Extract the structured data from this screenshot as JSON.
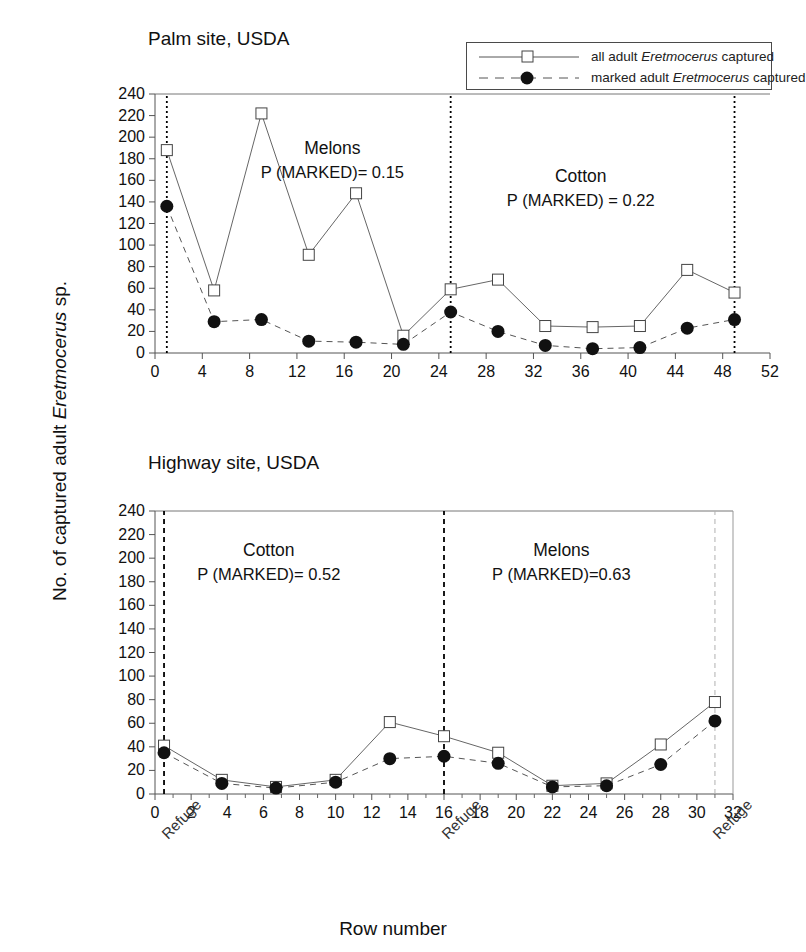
{
  "figure": {
    "ylabel_prefix": "No. of captured adult ",
    "ylabel_italic": "Eretmocerus",
    "ylabel_suffix": " sp.",
    "xlabel": "Row number"
  },
  "legend": {
    "all": {
      "prefix": "all adult ",
      "italic": "Eretmocerus",
      "suffix": " captured"
    },
    "marked": {
      "prefix": "marked adult ",
      "italic": "Eretmocerus",
      "suffix": " captured"
    }
  },
  "chart_data": [
    {
      "id": "palm",
      "type": "line",
      "title": "Palm site, USDA",
      "xlabel": "Row number",
      "ylabel": "No. of captured adult Eretmocerus sp.",
      "xlim": [
        0,
        52
      ],
      "ylim": [
        0,
        240
      ],
      "xticks": [
        0,
        4,
        8,
        12,
        16,
        20,
        24,
        28,
        32,
        36,
        40,
        44,
        48,
        52
      ],
      "yticks": [
        0,
        20,
        40,
        60,
        80,
        100,
        120,
        140,
        160,
        180,
        200,
        220,
        240
      ],
      "grid": false,
      "legend_position": "top-right",
      "series": [
        {
          "name": "all adult Eretmocerus captured",
          "marker": "open-square",
          "line": "solid",
          "x": [
            1,
            5,
            9,
            13,
            17,
            21,
            25,
            29,
            33,
            37,
            41,
            45,
            49
          ],
          "values": [
            188,
            58,
            222,
            91,
            148,
            16,
            59,
            68,
            25,
            24,
            25,
            77,
            56
          ]
        },
        {
          "name": "marked adult Eretmocerus captured",
          "marker": "filled-circle",
          "line": "dashed",
          "x": [
            1,
            5,
            9,
            13,
            17,
            21,
            25,
            29,
            33,
            37,
            41,
            45,
            49
          ],
          "values": [
            136,
            29,
            31,
            11,
            10,
            8,
            38,
            20,
            7,
            4,
            5,
            23,
            31
          ]
        }
      ],
      "markers": [
        {
          "x": 1,
          "label": "Refuge",
          "style": "dotted-black"
        },
        {
          "x": 25,
          "label": "Refuge",
          "style": "dotted-black"
        },
        {
          "x": 49,
          "label": "Refuge",
          "style": "dotted-black"
        }
      ],
      "annotations": [
        {
          "crop": "Melons",
          "text": "P (MARKED)= 0.15",
          "x": 15,
          "y": 178
        },
        {
          "crop": "Cotton",
          "text": "P (MARKED) = 0.22",
          "x": 36,
          "y": 152
        }
      ]
    },
    {
      "id": "highway",
      "type": "line",
      "title": "Highway site, USDA",
      "xlabel": "Row number",
      "ylabel": "No. of captured adult Eretmocerus sp.",
      "xlim": [
        0,
        32
      ],
      "ylim": [
        0,
        240
      ],
      "xticks": [
        0,
        2,
        4,
        6,
        8,
        10,
        12,
        14,
        16,
        18,
        20,
        22,
        24,
        26,
        28,
        30,
        32
      ],
      "yticks": [
        0,
        20,
        40,
        60,
        80,
        100,
        120,
        140,
        160,
        180,
        200,
        220,
        240
      ],
      "grid": false,
      "legend_position": "none",
      "series": [
        {
          "name": "all adult Eretmocerus captured",
          "marker": "open-square",
          "line": "solid",
          "x": [
            0.5,
            3.7,
            6.7,
            10,
            13,
            16,
            19,
            22,
            25,
            28,
            31
          ],
          "values": [
            41,
            12,
            6,
            12,
            61,
            49,
            35,
            7,
            9,
            42,
            78
          ]
        },
        {
          "name": "marked adult Eretmocerus captured",
          "marker": "filled-circle",
          "line": "dashed",
          "x": [
            0.5,
            3.7,
            6.7,
            10,
            13,
            16,
            19,
            22,
            25,
            28,
            31
          ],
          "values": [
            35,
            9,
            5,
            10,
            30,
            32,
            26,
            6,
            7,
            25,
            62
          ]
        }
      ],
      "markers": [
        {
          "x": 0.5,
          "label": "Refuge",
          "style": "dashed-black"
        },
        {
          "x": 16,
          "label": "Refuge",
          "style": "dashed-black"
        },
        {
          "x": 31,
          "label": "Refuge",
          "style": "dashed-gray"
        }
      ],
      "annotations": [
        {
          "crop": "Cotton",
          "text": "P (MARKED)= 0.52",
          "x": 6.3,
          "y": 196
        },
        {
          "crop": "Melons",
          "text": "P (MARKED)=0.63",
          "x": 22.5,
          "y": 196
        }
      ]
    }
  ]
}
